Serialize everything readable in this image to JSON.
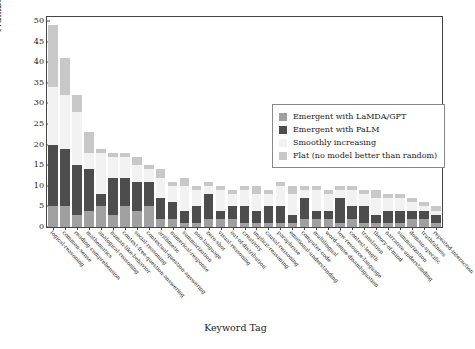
{
  "chart_data": {
    "type": "bar",
    "title": "",
    "xlabel": "Keyword Tag",
    "ylabel": "Number of tasks",
    "ylim": [
      0,
      51
    ],
    "yticks": [
      0,
      5,
      10,
      15,
      20,
      25,
      30,
      35,
      40,
      45,
      50
    ],
    "grid": false,
    "stacked": true,
    "legend_position": "upper right",
    "legend_entries": [
      "Emergent with LaMDA/GPT",
      "Emergent with PaLM",
      "Smoothly increasing",
      "Flat (no model better than random)"
    ],
    "colors": {
      "emergent_lamda_gpt": "#a0a0a0",
      "emergent_palm": "#4d4d4d",
      "smoothly_increasing": "#f2f2f2",
      "flat": "#c8c8c8"
    },
    "categories": [
      "logical-reasoning",
      "common-sense",
      "reading-comprehension",
      "mathematics",
      "analogical-reasoning",
      "human-like-behavior",
      "context-free-question-answering",
      "social-reasoning",
      "contextual-question-answering",
      "arithmetic",
      "numerical-response",
      "summarization",
      "non-language",
      "zero-shot",
      "visual-reasoning",
      "out-of-distribution",
      "creativity",
      "implicit-reasoning",
      "causal-reasoning",
      "paraphrase",
      "emotional-understanding",
      "computer-code",
      "multilingual",
      "word-sense-disambiguation",
      "low-resource-language",
      "context-length",
      "translation",
      "theory-of-mind",
      "narrative-understanding",
      "summarization-2",
      "domain-specific",
      "truthfulness",
      "repeated-interaction"
    ],
    "series": [
      {
        "name": "Emergent with LaMDA/GPT",
        "key": "emergent_lamda_gpt",
        "values": [
          5,
          5,
          3,
          4,
          5,
          3,
          5,
          4,
          5,
          2,
          2,
          1,
          1,
          2,
          2,
          2,
          1,
          1,
          1,
          1,
          1,
          2,
          2,
          2,
          1,
          2,
          1,
          1,
          1,
          1,
          2,
          2,
          1
        ]
      },
      {
        "name": "Emergent with PaLM",
        "key": "emergent_palm",
        "values": [
          15,
          14,
          12,
          10,
          3,
          9,
          7,
          7,
          6,
          5,
          4,
          3,
          4,
          6,
          2,
          3,
          4,
          3,
          4,
          4,
          2,
          5,
          2,
          2,
          6,
          3,
          4,
          2,
          3,
          3,
          2,
          2,
          2
        ]
      },
      {
        "name": "Smoothly increasing",
        "key": "smoothly_increasing",
        "values": [
          14,
          13,
          13,
          4,
          10,
          5,
          5,
          4,
          3,
          5,
          4,
          6,
          4,
          2,
          5,
          3,
          4,
          4,
          3,
          5,
          5,
          2,
          5,
          4,
          2,
          4,
          3,
          4,
          3,
          3,
          2,
          1,
          1
        ]
      },
      {
        "name": "Flat (no model better than random)",
        "key": "flat",
        "values": [
          15,
          9,
          4,
          5,
          1,
          1,
          1,
          2,
          1,
          2,
          1,
          2,
          1,
          1,
          1,
          1,
          1,
          2,
          1,
          1,
          2,
          1,
          1,
          1,
          1,
          1,
          1,
          2,
          1,
          1,
          1,
          1,
          1
        ]
      }
    ],
    "totals": [
      49,
      41,
      32,
      23,
      19,
      18,
      18,
      17,
      15,
      14,
      11,
      12,
      10,
      11,
      10,
      9,
      10,
      10,
      9,
      11,
      10,
      10,
      10,
      9,
      10,
      10,
      9,
      9,
      8,
      8,
      7,
      6,
      5
    ]
  }
}
